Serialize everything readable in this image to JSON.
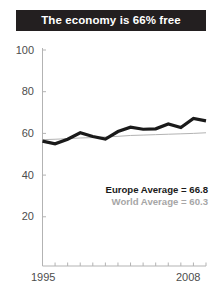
{
  "title": {
    "text": "The economy is 66% free",
    "bg": "#231f20",
    "color": "#ffffff"
  },
  "annotations": {
    "europe": "Europe Average = 66.8",
    "world": "World Average = 60.3"
  },
  "chart_data": {
    "type": "line",
    "title": "The economy is 66% free",
    "xlabel": "",
    "ylabel": "",
    "xlim": [
      1995,
      2008
    ],
    "ylim": [
      0,
      100
    ],
    "grid": false,
    "legend_position": "inside-bottom-right",
    "ytick_labels": [
      "100",
      "80",
      "60",
      "40",
      "20"
    ],
    "yticks": [
      100,
      80,
      60,
      40,
      20
    ],
    "xtick_labels": [
      "1995",
      "2008"
    ],
    "xticks": [
      1995,
      2008
    ],
    "x": [
      1995,
      1996,
      1997,
      1998,
      1999,
      2000,
      2001,
      2002,
      2003,
      2004,
      2005,
      2006,
      2007,
      2008
    ],
    "series": [
      {
        "name": "Europe Average",
        "color": "#1a1a1a",
        "width": 3.2,
        "final_value": 66.8,
        "values": [
          56.3,
          55.0,
          57.2,
          60.3,
          58.5,
          57.3,
          60.9,
          63.0,
          62.0,
          62.2,
          64.5,
          62.8,
          67.2,
          66.0
        ]
      },
      {
        "name": "World Average",
        "color": "#b3b3b3",
        "width": 1.0,
        "final_value": 60.3,
        "values": [
          57.0,
          57.2,
          57.5,
          57.8,
          58.0,
          58.3,
          58.6,
          59.0,
          59.2,
          59.4,
          59.6,
          59.8,
          60.0,
          60.3
        ]
      }
    ]
  },
  "axis": {
    "color": "#b3b3b3",
    "tick_color": "#b3b3b3"
  }
}
